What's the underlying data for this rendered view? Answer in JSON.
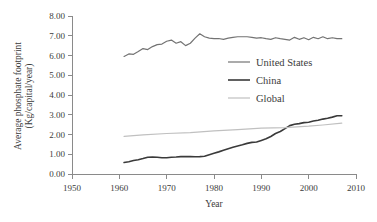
{
  "chart_data": {
    "type": "line",
    "title": "",
    "xlabel": "Year",
    "ylabel": "Average phosphate footprint (Kg/capital/year)",
    "ylabel_line1": "Average phosphate footprint",
    "ylabel_line2": "(Kg/capital/year)",
    "xlim": [
      1950,
      2010
    ],
    "ylim": [
      0.0,
      8.0
    ],
    "xticks": [
      1950,
      1960,
      1970,
      1980,
      1990,
      2000,
      2010
    ],
    "xtick_labels": [
      "1950",
      "1960",
      "1970",
      "1980",
      "1990",
      "2000",
      "2010"
    ],
    "yticks": [
      0.0,
      1.0,
      2.0,
      3.0,
      4.0,
      5.0,
      6.0,
      7.0,
      8.0
    ],
    "ytick_labels": [
      "0.00",
      "1.00",
      "2.00",
      "3.00",
      "4.00",
      "5.00",
      "6.00",
      "7.00",
      "8.00"
    ],
    "grid": false,
    "legend_position": "center-right-upper",
    "legend_entries": [
      "United States",
      "China",
      "Global"
    ],
    "series": [
      {
        "name": "United States",
        "color": "#737373",
        "stroke_width": 1.2,
        "x": [
          1961,
          1962,
          1963,
          1964,
          1965,
          1966,
          1967,
          1968,
          1969,
          1970,
          1971,
          1972,
          1973,
          1974,
          1975,
          1976,
          1977,
          1978,
          1979,
          1980,
          1981,
          1982,
          1983,
          1984,
          1985,
          1986,
          1987,
          1988,
          1989,
          1990,
          1991,
          1992,
          1993,
          1994,
          1995,
          1996,
          1997,
          1998,
          1999,
          2000,
          2001,
          2002,
          2003,
          2004,
          2005,
          2006,
          2007
        ],
        "y": [
          5.95,
          6.08,
          6.06,
          6.2,
          6.35,
          6.3,
          6.45,
          6.55,
          6.58,
          6.72,
          6.78,
          6.62,
          6.7,
          6.5,
          6.62,
          6.88,
          7.1,
          6.95,
          6.88,
          6.85,
          6.86,
          6.82,
          6.88,
          6.92,
          6.95,
          6.95,
          6.95,
          6.92,
          6.88,
          6.9,
          6.85,
          6.82,
          6.9,
          6.85,
          6.82,
          6.78,
          6.92,
          6.82,
          6.9,
          6.8,
          6.92,
          6.85,
          6.95,
          6.85,
          6.9,
          6.85,
          6.85
        ]
      },
      {
        "name": "China",
        "color": "#3a3a3a",
        "stroke_width": 1.6,
        "x": [
          1961,
          1962,
          1963,
          1964,
          1965,
          1966,
          1967,
          1968,
          1969,
          1970,
          1971,
          1972,
          1973,
          1974,
          1975,
          1976,
          1977,
          1978,
          1979,
          1980,
          1981,
          1982,
          1983,
          1984,
          1985,
          1986,
          1987,
          1988,
          1989,
          1990,
          1991,
          1992,
          1993,
          1994,
          1995,
          1996,
          1997,
          1998,
          1999,
          2000,
          2001,
          2002,
          2003,
          2004,
          2005,
          2006,
          2007
        ],
        "y": [
          0.58,
          0.62,
          0.68,
          0.72,
          0.78,
          0.85,
          0.86,
          0.85,
          0.82,
          0.82,
          0.85,
          0.86,
          0.88,
          0.88,
          0.88,
          0.87,
          0.88,
          0.9,
          0.98,
          1.05,
          1.12,
          1.2,
          1.28,
          1.35,
          1.42,
          1.48,
          1.55,
          1.6,
          1.62,
          1.7,
          1.78,
          1.9,
          2.05,
          2.15,
          2.3,
          2.45,
          2.52,
          2.55,
          2.6,
          2.62,
          2.68,
          2.72,
          2.78,
          2.82,
          2.88,
          2.95,
          2.95
        ]
      },
      {
        "name": "Global",
        "color": "#c0c0c0",
        "stroke_width": 1.2,
        "x": [
          1961,
          1965,
          1970,
          1975,
          1980,
          1985,
          1990,
          1995,
          2000,
          2003,
          2007
        ],
        "y": [
          1.9,
          1.98,
          2.05,
          2.1,
          2.18,
          2.25,
          2.32,
          2.35,
          2.42,
          2.48,
          2.58
        ]
      }
    ]
  },
  "axes": {
    "x_axis_title": "Year",
    "y_axis_title_line1": "Average phosphate footprint",
    "y_axis_title_line2": "(Kg/capital/year)"
  },
  "legend": {
    "items": [
      {
        "label": "United States",
        "color": "#737373"
      },
      {
        "label": "China",
        "color": "#3a3a3a"
      },
      {
        "label": "Global",
        "color": "#c0c0c0"
      }
    ]
  },
  "colors": {
    "axis": "#8a8a8a",
    "text": "#3b3b3b",
    "united_states": "#737373",
    "china": "#3a3a3a",
    "global": "#c0c0c0",
    "background": "#ffffff"
  }
}
